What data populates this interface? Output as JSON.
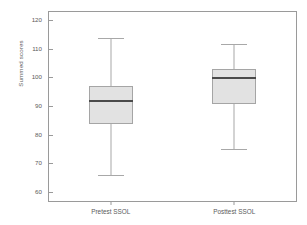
{
  "chart_data": {
    "type": "box",
    "title": "",
    "xlabel": "",
    "ylabel": "Summed scores",
    "ylim": [
      57,
      123
    ],
    "yticks": [
      60,
      70,
      80,
      90,
      100,
      110,
      120
    ],
    "ytick_labels": [
      "60",
      "70",
      "80",
      "90",
      "100",
      "110",
      "120"
    ],
    "grid": false,
    "legend": false,
    "categories": [
      "Pretest SSOL",
      "Posttest SSOL"
    ],
    "boxes": [
      {
        "name": "Pretest SSOL",
        "whisker_low": 66,
        "q1": 84,
        "median": 92,
        "q3": 97,
        "whisker_high": 114
      },
      {
        "name": "Posttest SSOL",
        "whisker_low": 75,
        "q1": 91,
        "median": 100,
        "q3": 103,
        "whisker_high": 112
      }
    ],
    "colors": {
      "box_fill": "#e2e2e2",
      "box_edge": "#a5a5a5",
      "median": "#4a4a4a",
      "whisker": "#a8a8a8",
      "frame": "#9a9a9a",
      "text": "#5a5a5a",
      "background": "#ffffff"
    }
  }
}
